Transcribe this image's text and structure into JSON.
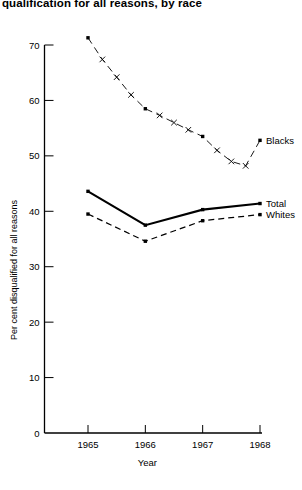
{
  "chart_data": {
    "type": "line",
    "title": "qualification for all reasons, by race",
    "xlabel": "Year",
    "ylabel": "Per cent disqualified for all reasons",
    "xlim": [
      1964.7,
      1968.3
    ],
    "ylim": [
      0,
      72
    ],
    "grid": false,
    "legend_position": "right-inline",
    "x_ticks": [
      "1965",
      "1966",
      "1967",
      "1968"
    ],
    "x_tick_values": [
      1965,
      1966,
      1967,
      1968
    ],
    "y_ticks": [
      "0",
      "10",
      "20",
      "30",
      "40",
      "50",
      "60",
      "70"
    ],
    "y_tick_values": [
      0,
      10,
      20,
      30,
      40,
      50,
      60,
      70
    ],
    "series": [
      {
        "name": "Blacks",
        "style": "dashed-x-markers",
        "x": [
          1965,
          1965.25,
          1965.5,
          1965.75,
          1966,
          1966.25,
          1966.5,
          1966.75,
          1967,
          1967.25,
          1967.5,
          1967.75,
          1968
        ],
        "values": [
          71.3,
          67.4,
          64.2,
          61.0,
          58.5,
          57.3,
          56.0,
          54.7,
          53.5,
          51.0,
          49.0,
          48.2,
          52.8
        ],
        "marker_values": [
          71.3,
          58.5,
          48.2,
          52.8
        ]
      },
      {
        "name": "Total",
        "style": "solid",
        "x": [
          1965,
          1966,
          1967,
          1968
        ],
        "values": [
          43.6,
          37.5,
          40.3,
          41.4
        ]
      },
      {
        "name": "Whites",
        "style": "dashed",
        "x": [
          1965,
          1966,
          1967,
          1968
        ],
        "values": [
          39.5,
          34.6,
          38.3,
          39.4
        ]
      }
    ]
  },
  "legend": {
    "blacks": "Blacks",
    "total": "Total",
    "whites": "Whites"
  },
  "colors": {
    "ink": "#000000",
    "background": "#ffffff"
  }
}
